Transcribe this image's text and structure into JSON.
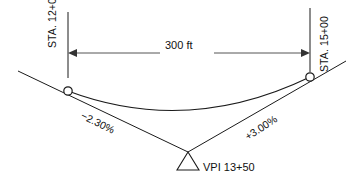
{
  "diagram": {
    "type": "vertical-sag-curve-profile",
    "background_color": "#ffffff",
    "line_color": "#1a1a1a",
    "dimension_color": "#555555",
    "stations": {
      "left": {
        "label": "STA. 12+00",
        "role": "BVC",
        "x": 68,
        "line_top": 12,
        "line_bottom": 78,
        "point_y": 91
      },
      "right": {
        "label": "STA. 15+00",
        "role": "EVC",
        "x": 310,
        "line_top": 8,
        "line_bottom": 72,
        "point_y": 77
      }
    },
    "dimension": {
      "label": "300 ft",
      "value": 300,
      "units": "ft",
      "y": 53,
      "x_start": 68,
      "x_end": 310,
      "arrow_left": "left-arrowhead",
      "arrow_right": "right-arrowhead"
    },
    "grades": {
      "incoming": {
        "label": "−2.30%",
        "value": -2.3,
        "units": "%"
      },
      "outgoing": {
        "label": "+3.00%",
        "value": 3.0,
        "units": "%"
      }
    },
    "vpi": {
      "label": "VPI 13+50",
      "station": "13+50",
      "marker": "triangle",
      "apex_x": 188,
      "apex_y": 152,
      "base_left_x": 177,
      "base_right_x": 199,
      "base_y": 170
    },
    "geometry": {
      "left_tangent_start": [
        18,
        71
      ],
      "left_tangent_end": [
        188,
        152
      ],
      "right_tangent_start": [
        188,
        152
      ],
      "right_tangent_end": [
        346,
        61
      ],
      "curve_start": [
        68,
        91
      ],
      "curve_control": [
        188,
        136
      ],
      "curve_end": [
        310,
        77
      ],
      "curve_low_point": [
        197,
        113
      ]
    }
  }
}
